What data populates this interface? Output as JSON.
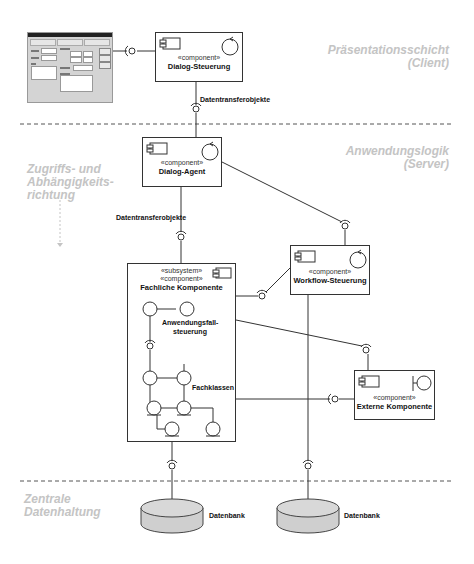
{
  "layers": [
    {
      "id": "praesentation",
      "title": "Präsentationsschicht",
      "subtitle": "(Client)"
    },
    {
      "id": "anwendung",
      "title": "Anwendungslogik",
      "subtitle": "(Server)"
    },
    {
      "id": "daten",
      "title": "Zentrale",
      "subtitle": "Datenhaltung"
    }
  ],
  "direction_note": {
    "line1": "Zugriffs- und",
    "line2": "Abhängigkeits-",
    "line3": "richtung"
  },
  "components": {
    "dialog_steuerung": {
      "stereotype": "«component»",
      "name": "Dialog-Steuerung"
    },
    "dialog_agent": {
      "stereotype": "«component»",
      "name": "Dialog-Agent"
    },
    "fachliche_komponente": {
      "stereotype1": "«subsystem»",
      "stereotype2": "«component»",
      "name": "Fachliche Komponente"
    },
    "workflow_steuerung": {
      "stereotype": "«component»",
      "name": "Workflow-Steuerung"
    },
    "externe_komponente": {
      "stereotype": "«component»",
      "name": "Externe Komponente"
    }
  },
  "inner_labels": {
    "anwendungsfall_line1": "Anwendungsfall-",
    "anwendungsfall_line2": "steuerung",
    "fachklassen": "Fachklassen"
  },
  "connector_labels": {
    "dto_top": "Datentransferobjekte",
    "dto_mid": "Datentransferobjekte"
  },
  "databases": [
    {
      "label": "Datenbank"
    },
    {
      "label": "Datenbank"
    }
  ],
  "colors": {
    "layer_label": "#c4c4c4",
    "line": "#333333",
    "db_fill": "#d2d2d2",
    "mock_bg": "#d4d4d4"
  }
}
